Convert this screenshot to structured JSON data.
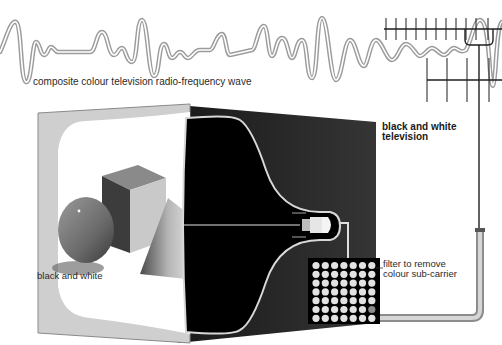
{
  "labels": {
    "wave": "composite colour television radio-frequency wave",
    "screen_image": "black and white",
    "tv_title_line1": "black and white",
    "tv_title_line2": "television",
    "filter_line1": "filter to remove",
    "filter_line2": "colour sub-carrier"
  },
  "components": {
    "antenna": "aerial",
    "cable": "aerial lead",
    "tube": "cathode ray tube",
    "filter_grid": {
      "rows": 7,
      "cols": 7
    },
    "screen_objects": [
      "sphere",
      "cube",
      "cone"
    ]
  },
  "colors": {
    "cabinet": "#2b2b2b",
    "tube": "#000000",
    "bezel": "#cfcfcf",
    "screen": "#ffffff",
    "wave": "#9a9a9a",
    "antenna": "#1e1e1e"
  }
}
